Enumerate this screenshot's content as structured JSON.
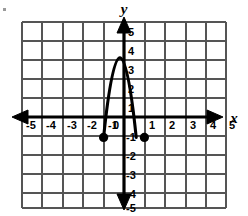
{
  "figure": {
    "type": "cartesian-graph",
    "background_color": "#ffffff",
    "grid_color": "#555555",
    "axis_color": "#000000",
    "curve_color": "#000000",
    "point_color": "#000000"
  },
  "axes": {
    "x_axis_label": "x",
    "y_axis_label": "y",
    "x_ticks": [
      "-5",
      "-4",
      "-3",
      "-2",
      "-1",
      "1",
      "2",
      "3",
      "4",
      "5"
    ],
    "y_ticks": [
      "5",
      "4",
      "3",
      "2",
      "1",
      "-1",
      "-2",
      "-3",
      "-4",
      "-5"
    ],
    "origin_label": "0"
  },
  "chart_data": {
    "type": "line",
    "title": "",
    "xlabel": "x",
    "ylabel": "y",
    "xlim": [
      -5.5,
      5.5
    ],
    "ylim": [
      -5.5,
      5.5
    ],
    "xticks": [
      -5,
      -4,
      -3,
      -2,
      -1,
      0,
      1,
      2,
      3,
      4,
      5
    ],
    "yticks": [
      -5,
      -4,
      -3,
      -2,
      -1,
      0,
      1,
      2,
      3,
      4,
      5
    ],
    "grid": true,
    "legend": "none",
    "series": [
      {
        "name": "parabola",
        "kind": "curve",
        "description": "downward-opening parabola with vertex near (-0.2, 2.9) passing through (-1,-1) and (1,-1)",
        "vertex": [
          -0.2,
          2.9
        ],
        "x": [
          -1.0,
          -0.9,
          -0.8,
          -0.7,
          -0.6,
          -0.5,
          -0.4,
          -0.3,
          -0.2,
          -0.1,
          0.0,
          0.1,
          0.2,
          0.3,
          0.4,
          0.5,
          0.6,
          0.7,
          0.8,
          0.9,
          1.0
        ],
        "y": [
          -1.0,
          0.44,
          1.56,
          2.4,
          2.84,
          2.98,
          2.84,
          2.4,
          1.56,
          0.44,
          -1.0,
          -1.0,
          -1.0,
          -1.0,
          -1.0,
          -1.0,
          -1.0,
          -1.0,
          -1.0,
          -1.0,
          -1.0
        ]
      },
      {
        "name": "marked-points",
        "kind": "scatter",
        "points": [
          [
            -1,
            -1
          ],
          [
            1,
            -1
          ]
        ]
      }
    ]
  }
}
